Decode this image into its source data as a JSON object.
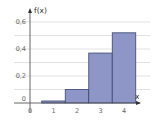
{
  "chart_data": {
    "type": "bar",
    "title": "",
    "xlabel": "x",
    "ylabel": "f(x)",
    "categories": [
      "1",
      "2",
      "3",
      "4"
    ],
    "x": [
      1,
      2,
      3,
      4
    ],
    "values": [
      0.015,
      0.1,
      0.37,
      0.52
    ],
    "x_ticks": [
      "0",
      "1",
      "2",
      "3",
      "4"
    ],
    "y_ticks": [
      "0",
      "0.2",
      "0.4",
      "0.6"
    ],
    "y_tick_values": [
      0,
      0.2,
      0.4,
      0.6
    ],
    "ylim": [
      0,
      0.6
    ],
    "xlim": [
      0,
      5
    ],
    "grid": true,
    "gridline_step": 0.1,
    "bar_width": 1,
    "legend": null,
    "colors": {
      "bar_fill": "#8d96c6",
      "bar_stroke": "#3b4470",
      "grid": "#d6d6d6",
      "axis": "#555555"
    }
  }
}
